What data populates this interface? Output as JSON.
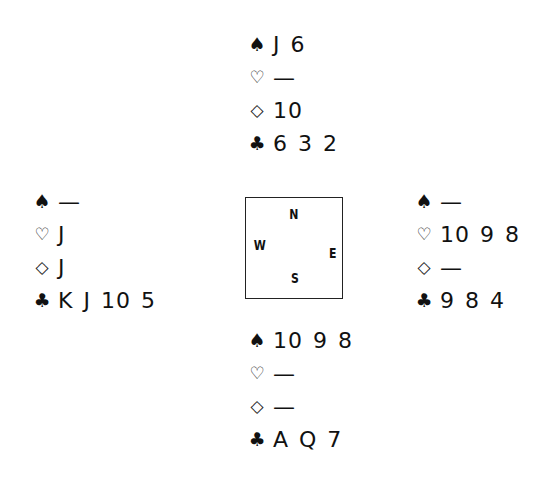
{
  "diagram": {
    "type": "bridge-deal",
    "compass": {
      "north": "N",
      "west": "W",
      "east": "E",
      "south": "S"
    },
    "hands": {
      "north": {
        "spades": {
          "symbol": "♠",
          "cards": "J 6"
        },
        "hearts": {
          "symbol": "♡",
          "cards": "—"
        },
        "diamonds": {
          "symbol": "◇",
          "cards": "10"
        },
        "clubs": {
          "symbol": "♣",
          "cards": "6 3 2"
        }
      },
      "west": {
        "spades": {
          "symbol": "♠",
          "cards": "—"
        },
        "hearts": {
          "symbol": "♡",
          "cards": "J"
        },
        "diamonds": {
          "symbol": "◇",
          "cards": "J"
        },
        "clubs": {
          "symbol": "♣",
          "cards": "K J 10 5"
        }
      },
      "east": {
        "spades": {
          "symbol": "♠",
          "cards": "—"
        },
        "hearts": {
          "symbol": "♡",
          "cards": "10 9 8"
        },
        "diamonds": {
          "symbol": "◇",
          "cards": "—"
        },
        "clubs": {
          "symbol": "♣",
          "cards": "9 8 4"
        }
      },
      "south": {
        "spades": {
          "symbol": "♠",
          "cards": "10 9 8"
        },
        "hearts": {
          "symbol": "♡",
          "cards": "—"
        },
        "diamonds": {
          "symbol": "◇",
          "cards": "—"
        },
        "clubs": {
          "symbol": "♣",
          "cards": "A Q 7"
        }
      }
    }
  }
}
